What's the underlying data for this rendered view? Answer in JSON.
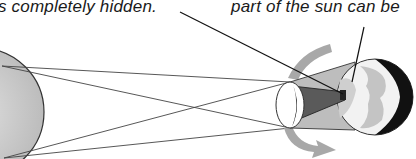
{
  "diagram": {
    "type": "solar-eclipse",
    "labels": {
      "umbra_caption": "s completely hidden.",
      "penumbra_caption": "part of the sun can be"
    },
    "bodies": {
      "sun": {
        "name": "Sun",
        "fill": "#cfcfcf"
      },
      "moon": {
        "name": "Moon",
        "fill": "#ffffff"
      },
      "earth": {
        "name": "Earth",
        "fill": "#f2f2f2",
        "night_side": "#111111"
      }
    },
    "regions": {
      "umbra": {
        "fill": "#555555"
      },
      "penumbra": {
        "fill": "#bdbdbd"
      }
    },
    "arrows": {
      "orbit_color": "#a8a8a8"
    },
    "colors": {
      "line": "#333333",
      "background": "#ffffff"
    }
  }
}
